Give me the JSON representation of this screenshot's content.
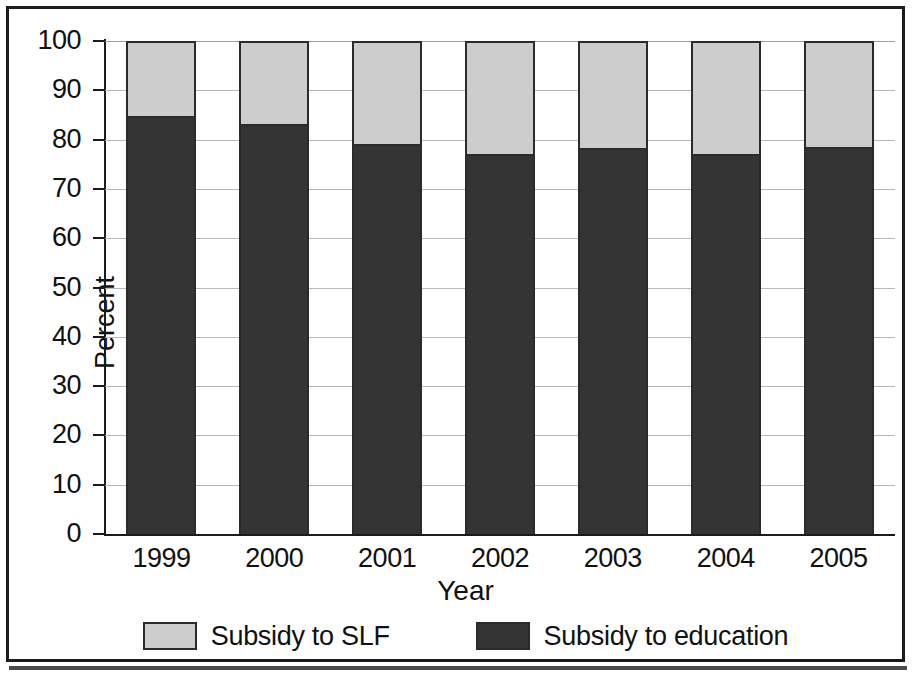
{
  "chart_data": {
    "type": "bar",
    "subtype": "stacked-column-100",
    "title": "",
    "xlabel": "Year",
    "ylabel": "Percent",
    "categories": [
      "1999",
      "2000",
      "2001",
      "2002",
      "2003",
      "2004",
      "2005"
    ],
    "series": [
      {
        "name": "Subsidy to education",
        "color": "#343434",
        "values": [
          84.7,
          83.2,
          79.2,
          77.0,
          78.4,
          77.0,
          78.6
        ]
      },
      {
        "name": "Subsidy to SLF",
        "color": "#cdcdcd",
        "values": [
          15.3,
          16.8,
          20.8,
          23.0,
          21.6,
          23.0,
          21.4
        ]
      }
    ],
    "stack_order": [
      "Subsidy to education",
      "Subsidy to SLF"
    ],
    "ylim": [
      0,
      100
    ],
    "ytick_values": [
      0,
      10,
      20,
      30,
      40,
      50,
      60,
      70,
      80,
      90,
      100
    ],
    "ytick_labels": [
      "0",
      "10",
      "20",
      "30",
      "40",
      "50",
      "60",
      "70",
      "80",
      "90",
      "100"
    ],
    "grid": true,
    "grid_axis": "y",
    "legend_position": "bottom"
  },
  "axes": {
    "y_title": "Percent",
    "x_title": "Year",
    "y_ticks": [
      "100",
      "90",
      "80",
      "70",
      "60",
      "50",
      "40",
      "30",
      "20",
      "10",
      "0"
    ],
    "x_ticks": [
      "1999",
      "2000",
      "2001",
      "2002",
      "2003",
      "2004",
      "2005"
    ]
  },
  "legend": {
    "items": [
      {
        "label": "Subsidy to SLF",
        "color": "#cdcdcd"
      },
      {
        "label": "Subsidy to education",
        "color": "#343434"
      }
    ]
  },
  "colors": {
    "subsidy_slf": "#cdcdcd",
    "subsidy_education": "#343434",
    "axis": "#1b1b1b",
    "grid": "#b9b9b9",
    "frame": "#1b1b1b"
  }
}
